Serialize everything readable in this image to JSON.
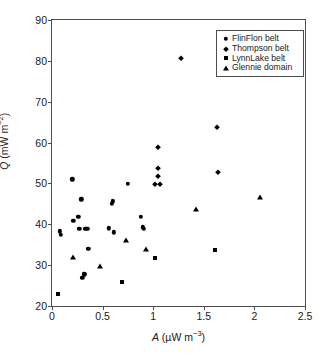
{
  "chart_data": {
    "type": "scatter",
    "title": "",
    "xlabel": "A (µW m−3)",
    "ylabel": "Q (mW m−2)",
    "xlim": [
      0,
      2.5
    ],
    "ylim": [
      20,
      90
    ],
    "xticks": [
      "0",
      "0.5",
      "1",
      "1.5",
      "2",
      "2.5"
    ],
    "xtick_values": [
      0,
      0.5,
      1,
      1.5,
      2,
      2.5
    ],
    "yticks": [
      "20",
      "30",
      "40",
      "50",
      "60",
      "70",
      "80",
      "90"
    ],
    "ytick_values": [
      20,
      30,
      40,
      50,
      60,
      70,
      80,
      90
    ],
    "grid": false,
    "legend_position": "top-right",
    "series": [
      {
        "name": "FlinFlon belt",
        "marker": "circle",
        "color": "#000000",
        "points": [
          [
            0.08,
            38.3
          ],
          [
            0.09,
            37.4
          ],
          [
            0.2,
            51.0
          ],
          [
            0.21,
            40.9
          ],
          [
            0.26,
            41.9
          ],
          [
            0.27,
            38.9
          ],
          [
            0.29,
            46.1
          ],
          [
            0.3,
            26.9
          ],
          [
            0.32,
            27.8
          ],
          [
            0.33,
            38.9
          ],
          [
            0.35,
            38.9
          ],
          [
            0.36,
            34.0
          ],
          [
            0.56,
            39.0
          ],
          [
            0.59,
            45.0
          ],
          [
            0.6,
            45.6
          ],
          [
            0.61,
            38.0
          ],
          [
            0.75,
            49.9
          ],
          [
            0.88,
            41.8
          ],
          [
            0.9,
            39.3
          ],
          [
            0.91,
            38.9
          ]
        ]
      },
      {
        "name": "Thompson belt",
        "marker": "diamond",
        "color": "#000000",
        "points": [
          [
            1.05,
            58.9
          ],
          [
            1.05,
            53.8
          ],
          [
            1.05,
            51.7
          ],
          [
            1.02,
            49.9
          ],
          [
            1.07,
            49.9
          ],
          [
            1.27,
            80.8
          ],
          [
            1.63,
            63.8
          ],
          [
            1.64,
            52.7
          ]
        ]
      },
      {
        "name": "LynnLake belt",
        "marker": "square",
        "color": "#000000",
        "points": [
          [
            0.06,
            23.0
          ],
          [
            0.69,
            25.9
          ],
          [
            1.02,
            31.8
          ],
          [
            1.61,
            33.8
          ]
        ]
      },
      {
        "name": "Glennie domain",
        "marker": "triangle",
        "color": "#000000",
        "points": [
          [
            0.21,
            32.1
          ],
          [
            0.47,
            29.9
          ],
          [
            0.73,
            36.1
          ],
          [
            0.93,
            34.0
          ],
          [
            1.42,
            43.8
          ],
          [
            2.06,
            46.8
          ]
        ]
      }
    ]
  },
  "legend": {
    "items": [
      {
        "label": "FlinFlon belt",
        "marker": "circle"
      },
      {
        "label": "Thompson belt",
        "marker": "diamond"
      },
      {
        "label": "LynnLake belt",
        "marker": "square"
      },
      {
        "label": "Glennie domain",
        "marker": "triangle"
      }
    ]
  }
}
